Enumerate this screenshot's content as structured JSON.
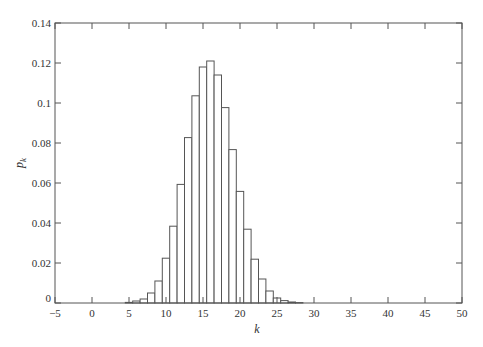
{
  "chart_data": {
    "type": "bar",
    "title": "",
    "xlabel": "k",
    "ylabel": "p_k",
    "xlim": [
      -5,
      50
    ],
    "ylim": [
      0,
      0.14
    ],
    "grid": false,
    "legend": null,
    "xticks": [
      -5,
      0,
      5,
      10,
      15,
      20,
      25,
      30,
      35,
      40,
      45,
      50
    ],
    "xtick_labels": [
      "−5",
      "0",
      "5",
      "10",
      "15",
      "20",
      "25",
      "30",
      "35",
      "40",
      "45",
      "50"
    ],
    "yticks": [
      0,
      0.02,
      0.04,
      0.06,
      0.08,
      0.1,
      0.12,
      0.14
    ],
    "ytick_labels": [
      "0",
      "0.02",
      "0.04",
      "0.06",
      "0.08",
      "0.1",
      "0.12",
      "0.14"
    ],
    "categories": [
      5,
      6,
      7,
      8,
      9,
      10,
      11,
      12,
      13,
      14,
      15,
      16,
      17,
      18,
      19,
      20,
      21,
      22,
      23,
      24,
      25,
      26,
      27,
      28
    ],
    "values": [
      0.0003,
      0.001,
      0.002,
      0.005,
      0.011,
      0.0224,
      0.0384,
      0.0593,
      0.0827,
      0.1036,
      0.118,
      0.121,
      0.114,
      0.0977,
      0.0767,
      0.0558,
      0.0369,
      0.0219,
      0.012,
      0.006,
      0.0025,
      0.0012,
      0.0005,
      0.0002
    ],
    "bar_style": {
      "fill": "#ffffff",
      "stroke": "#555555"
    }
  },
  "colors": {
    "axis": "#555555",
    "bar_edge": "#555555",
    "text": "#333333",
    "background": "#ffffff"
  }
}
